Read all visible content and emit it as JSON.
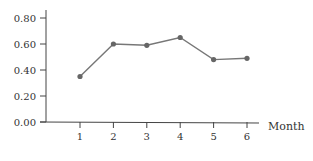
{
  "chart_data": {
    "type": "line",
    "title": "",
    "xlabel": "Month",
    "ylabel": "",
    "x": [
      1,
      2,
      3,
      4,
      5,
      6
    ],
    "categories": [
      "1",
      "2",
      "3",
      "4",
      "5",
      "6"
    ],
    "series": [
      {
        "name": "",
        "values": [
          0.35,
          0.6,
          0.59,
          0.65,
          0.48,
          0.49
        ]
      }
    ],
    "ylim": [
      0,
      0.8
    ],
    "yticks": [
      "0.00",
      "0.20",
      "0.40",
      "0.60",
      "0.80"
    ],
    "xticks": [
      "1",
      "2",
      "3",
      "4",
      "5",
      "6"
    ],
    "grid": false,
    "legend": null
  },
  "style": {
    "line_color": "#777777",
    "marker_color": "#666666",
    "axis_color": "#444444",
    "text_color": "#333333"
  }
}
